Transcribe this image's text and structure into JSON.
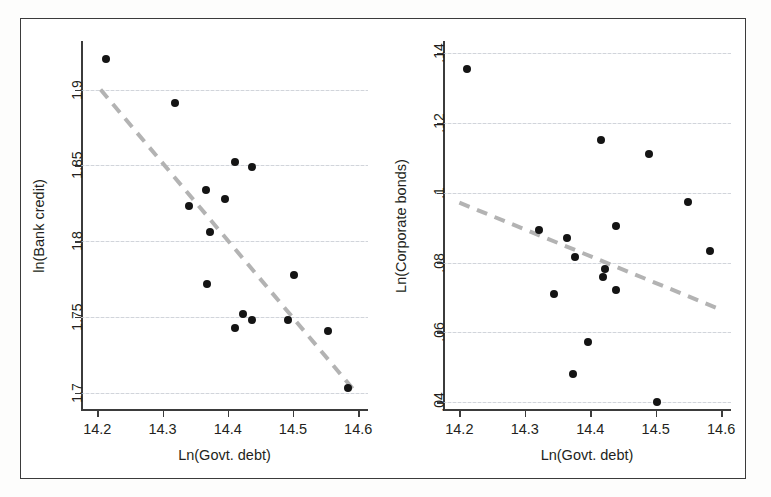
{
  "figure": {
    "width": 771,
    "height": 497,
    "background": "#fdfdfc",
    "frame_color": "#3b3b3b",
    "marker_color": "#141414",
    "fitline_color": "#b3b3b3",
    "gridline_color": "#c9cdd4"
  },
  "chart_data": [
    {
      "type": "scatter",
      "panel": "left",
      "title": "",
      "xlabel": "Ln(Govt. debt)",
      "ylabel": "ln(Bank credit)",
      "xlim": [
        14.175,
        14.615
      ],
      "ylim": [
        1.688,
        1.932
      ],
      "xticks": [
        14.2,
        14.3,
        14.4,
        14.5,
        14.6
      ],
      "xticklabels": [
        "14.2",
        "14.3",
        "14.4",
        "14.5",
        "14.6"
      ],
      "yticks": [
        1.7,
        1.75,
        1.8,
        1.85,
        1.9
      ],
      "yticklabels": [
        "1.7",
        "1.75",
        "1.8",
        "1.85",
        "1.9"
      ],
      "grid": "horizontal",
      "legend": "none",
      "points": [
        {
          "x": 14.213,
          "y": 1.92
        },
        {
          "x": 14.319,
          "y": 1.891
        },
        {
          "x": 14.411,
          "y": 1.852
        },
        {
          "x": 14.437,
          "y": 1.849
        },
        {
          "x": 14.366,
          "y": 1.834
        },
        {
          "x": 14.395,
          "y": 1.828
        },
        {
          "x": 14.34,
          "y": 1.823
        },
        {
          "x": 14.372,
          "y": 1.806
        },
        {
          "x": 14.368,
          "y": 1.772
        },
        {
          "x": 14.501,
          "y": 1.778
        },
        {
          "x": 14.424,
          "y": 1.752
        },
        {
          "x": 14.437,
          "y": 1.748
        },
        {
          "x": 14.492,
          "y": 1.748
        },
        {
          "x": 14.411,
          "y": 1.743
        },
        {
          "x": 14.553,
          "y": 1.741
        },
        {
          "x": 14.585,
          "y": 1.703
        }
      ],
      "fit": {
        "style": "dashed",
        "x0": 14.205,
        "y0": 1.9,
        "x1": 14.597,
        "y1": 1.7
      }
    },
    {
      "type": "scatter",
      "panel": "right",
      "title": "",
      "xlabel": "Ln(Govt. debt)",
      "ylabel": "Ln(Corporate bonds)",
      "xlim": [
        14.175,
        14.615
      ],
      "ylim": [
        0.0375,
        0.1435
      ],
      "xticks": [
        14.2,
        14.3,
        14.4,
        14.5,
        14.6
      ],
      "xticklabels": [
        "14.2",
        "14.3",
        "14.4",
        "14.5",
        "14.6"
      ],
      "yticks": [
        0.04,
        0.06,
        0.08,
        0.1,
        0.12,
        0.14
      ],
      "yticklabels": [
        ".04",
        ".06",
        ".08",
        ".1",
        ".12",
        ".14"
      ],
      "grid": "horizontal",
      "legend": "none",
      "points": [
        {
          "x": 14.211,
          "y": 0.1355
        },
        {
          "x": 14.416,
          "y": 0.115
        },
        {
          "x": 14.489,
          "y": 0.1112
        },
        {
          "x": 14.549,
          "y": 0.0975
        },
        {
          "x": 14.44,
          "y": 0.0905
        },
        {
          "x": 14.322,
          "y": 0.0893
        },
        {
          "x": 14.364,
          "y": 0.087
        },
        {
          "x": 14.583,
          "y": 0.0832
        },
        {
          "x": 14.377,
          "y": 0.0815
        },
        {
          "x": 14.423,
          "y": 0.0782
        },
        {
          "x": 14.42,
          "y": 0.076
        },
        {
          "x": 14.44,
          "y": 0.0722
        },
        {
          "x": 14.345,
          "y": 0.071
        },
        {
          "x": 14.396,
          "y": 0.0572
        },
        {
          "x": 14.374,
          "y": 0.048
        },
        {
          "x": 14.502,
          "y": 0.04
        }
      ],
      "fit": {
        "style": "dashed",
        "x0": 14.2,
        "y0": 0.0972,
        "x1": 14.6,
        "y1": 0.0665
      }
    }
  ]
}
